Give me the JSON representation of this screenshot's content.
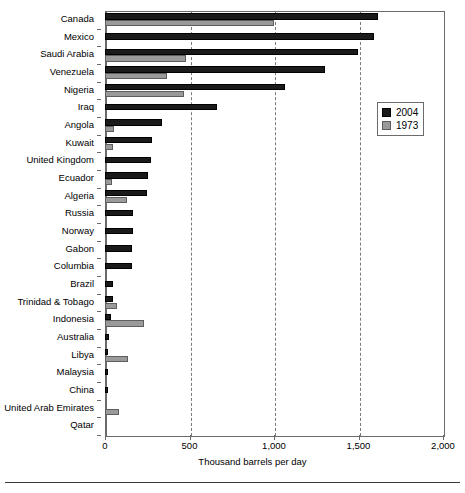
{
  "chart_data": {
    "type": "bar",
    "orientation": "horizontal",
    "title": "",
    "xlabel": "Thousand barrels per day",
    "ylabel": "",
    "xlim": [
      0,
      2000
    ],
    "xticks": [
      0,
      500,
      1000,
      1500,
      2000
    ],
    "xticklabels": [
      "0",
      "500",
      "1,000",
      "1,500",
      "2,000"
    ],
    "grid": "vertical-dashed",
    "legend_position": "upper-right-inside",
    "categories": [
      "Canada",
      "Mexico",
      "Saudi Arabia",
      "Venezuela",
      "Nigeria",
      "Iraq",
      "Angola",
      "Kuwait",
      "United Kingdom",
      "Ecuador",
      "Algeria",
      "Russia",
      "Norway",
      "Gabon",
      "Columbia",
      "Brazil",
      "Trinidad & Tobago",
      "Indonesia",
      "Australia",
      "Libya",
      "Malaysia",
      "China",
      "United Arab Emirates",
      "Qatar"
    ],
    "series": [
      {
        "name": "2004",
        "color": "#1a1a1a",
        "values": [
          1616,
          1593,
          1495,
          1304,
          1065,
          663,
          337,
          278,
          272,
          254,
          248,
          168,
          166,
          160,
          159,
          48,
          48,
          36,
          25,
          20,
          20,
          20,
          0,
          0
        ]
      },
      {
        "name": "1973",
        "color": "#9a9a9a",
        "values": [
          1000,
          0,
          478,
          367,
          468,
          0,
          53,
          47,
          0,
          41,
          130,
          0,
          0,
          0,
          0,
          0,
          72,
          232,
          0,
          137,
          0,
          0,
          85,
          0
        ]
      }
    ]
  },
  "legend": {
    "items": [
      {
        "label": "2004",
        "swatch": "black-swatch-icon"
      },
      {
        "label": "1973",
        "swatch": "gray-swatch-icon"
      }
    ]
  },
  "axis": {
    "x_title": "Thousand barrels per day"
  },
  "colors": {
    "series_2004": "#1a1a1a",
    "series_1973": "#9a9a9a",
    "frame": "#6b6b6b",
    "gridline": "#7a7a7a",
    "background": "#ffffff"
  }
}
